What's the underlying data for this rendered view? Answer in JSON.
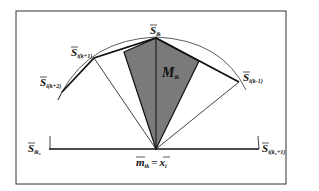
{
  "figure": {
    "type": "geometric-diagram",
    "frame": {
      "x": 16,
      "y": 11,
      "width": 270,
      "height": 173,
      "stroke": "#333333"
    },
    "colors": {
      "shade": "#7a7a7a",
      "line": "#111111",
      "background": "#ffffff"
    },
    "labels": {
      "s_ik": {
        "main": "S",
        "sub": "ik"
      },
      "s_ik_plus1": {
        "main": "S",
        "sub": "i(k+1)"
      },
      "s_ik_plus2": {
        "main": "S",
        "sub": "i(k+2)"
      },
      "s_ik_minus1": {
        "main": "S",
        "sub": "i(k-1)"
      },
      "s_ik0": {
        "main": "S",
        "sub": "ik₀"
      },
      "s_ik0_plus1": {
        "main": "S",
        "sub": "i(k₀+1)"
      },
      "region": {
        "main": "M",
        "sub": "ik"
      },
      "base_point": {
        "lhs_main": "m",
        "lhs_sub": "ik",
        "eq": "=",
        "rhs_main": "x",
        "rhs_sub": "i"
      }
    },
    "points": {
      "base": [
        156,
        149
      ],
      "s_ik": [
        156,
        38
      ],
      "s_ik_plus1": [
        94,
        58
      ],
      "s_ik_plus2": [
        62,
        92
      ],
      "s_ik_minus1": [
        239,
        82
      ],
      "s_ik0": [
        49,
        149
      ],
      "s_ik0_plus1": [
        259,
        149
      ]
    }
  }
}
